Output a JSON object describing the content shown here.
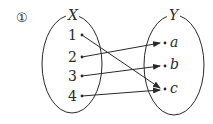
{
  "problem_number": "①",
  "domain_set": {
    "label": "X",
    "elements": [
      "1",
      "2",
      "3",
      "4"
    ]
  },
  "codomain_set": {
    "label": "Y",
    "elements": [
      "a",
      "b",
      "c"
    ]
  },
  "mapping": [
    {
      "from": "1",
      "to": "c"
    },
    {
      "from": "2",
      "to": "a"
    },
    {
      "from": "3",
      "to": "b"
    },
    {
      "from": "4",
      "to": "c"
    }
  ],
  "colors": {
    "stroke": "#2a2a2a",
    "background": "#ffffff"
  }
}
